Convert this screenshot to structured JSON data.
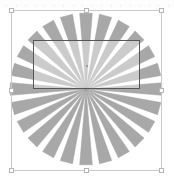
{
  "app": {
    "title": "Shape Selection Canvas",
    "canvas_width": 174,
    "canvas_height": 179,
    "background_color": "#ffffff"
  },
  "ruler": {
    "visible": true,
    "tick_color": "#f2f2f2",
    "tick_count": 18
  },
  "selection": {
    "name": "bounding-box",
    "x": 11,
    "y": 10,
    "width": 151,
    "height": 161,
    "stroke_color": "#c9c9c9",
    "handle_fill": "#ffffff",
    "handle_stroke": "#b5b5b5",
    "handle_size": 5,
    "handles": [
      {
        "id": "nw",
        "label": "top-left"
      },
      {
        "id": "n",
        "label": "top-center"
      },
      {
        "id": "ne",
        "label": "top-right"
      },
      {
        "id": "w",
        "label": "middle-left"
      },
      {
        "id": "e",
        "label": "middle-right"
      },
      {
        "id": "sw",
        "label": "bottom-left"
      },
      {
        "id": "s",
        "label": "bottom-center"
      },
      {
        "id": "se",
        "label": "bottom-right"
      }
    ]
  },
  "crop_rect": {
    "name": "crop-rectangle",
    "x": 33,
    "y": 40,
    "width": 107,
    "height": 49,
    "stroke_color": "#575757",
    "fill_color": "rgba(255,255,255,0.40)",
    "anchor_x": 86,
    "anchor_y": 65
  },
  "starburst": {
    "name": "starburst-shape",
    "center_x": 86,
    "center_y": 89,
    "radius": 76,
    "ray_count": 24,
    "ray_angular_width_deg": 9.5,
    "fill_color": "#a8a8a8",
    "stroke_color": "#a0a0a0"
  },
  "chart_data": {
    "type": "pie",
    "title": "",
    "xlabel": "",
    "ylabel": "",
    "categories": [
      "ray-01",
      "ray-02",
      "ray-03",
      "ray-04",
      "ray-05",
      "ray-06",
      "ray-07",
      "ray-08",
      "ray-09",
      "ray-10",
      "ray-11",
      "ray-12",
      "ray-13",
      "ray-14",
      "ray-15",
      "ray-16",
      "ray-17",
      "ray-18",
      "ray-19",
      "ray-20",
      "ray-21",
      "ray-22",
      "ray-23",
      "ray-24"
    ],
    "values": [
      76,
      76,
      76,
      76,
      76,
      76,
      76,
      76,
      76,
      76,
      76,
      76,
      76,
      76,
      76,
      76,
      76,
      76,
      76,
      76,
      76,
      76,
      76,
      76
    ],
    "legend_position": "none",
    "grid": false
  }
}
